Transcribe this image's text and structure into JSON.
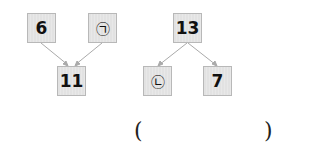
{
  "tree_left": {
    "top_left": "6",
    "top_right": "㉠",
    "bottom": "11"
  },
  "tree_right": {
    "top": "13",
    "bottom_left": "㉡",
    "bottom_right": "7"
  },
  "answer": {
    "open": "(",
    "close": ")"
  }
}
